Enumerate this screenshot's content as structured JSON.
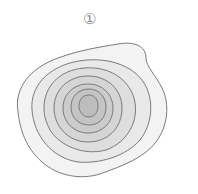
{
  "figure": {
    "label": "①",
    "contour_count": 7,
    "line_color": "#7a7a7a",
    "fill_colors": [
      "#f3f3f3",
      "#e9e9e9",
      "#dedede",
      "#d5d5d5",
      "#cccccc",
      "#c4c4c4",
      "#bdbdbd",
      "#b3b3b3"
    ]
  }
}
